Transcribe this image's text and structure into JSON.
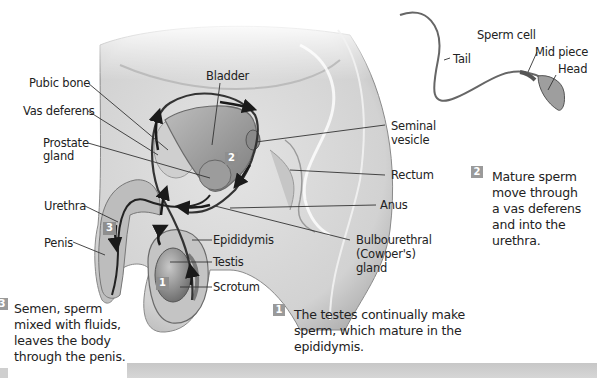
{
  "diagram": {
    "labels": {
      "pubic_bone": "Pubic bone",
      "vas_deferens": "Vas deferens",
      "prostate_line1": "Prostate",
      "prostate_line2": "gland",
      "bladder": "Bladder",
      "seminal_line1": "Seminal",
      "seminal_line2": "vesicle",
      "rectum": "Rectum",
      "anus": "Anus",
      "bulbo_line1": "Bulbourethral",
      "bulbo_line2": "(Cowper's)",
      "bulbo_line3": "gland",
      "urethra": "Urethra",
      "penis": "Penis",
      "epididymis": "Epididymis",
      "testis": "Testis",
      "scrotum": "Scrotum"
    },
    "sperm": {
      "title": "Sperm cell",
      "tail": "Tail",
      "mid_piece": "Mid piece",
      "head": "Head"
    },
    "markers": [
      "1",
      "2",
      "3"
    ],
    "steps": [
      {
        "number": "1",
        "lines": [
          "The testes continually make",
          "sperm, which mature in the",
          "epididymis."
        ]
      },
      {
        "number": "2",
        "lines": [
          "Mature sperm",
          "move through",
          "a vas deferens",
          "and into the",
          "urethra."
        ]
      },
      {
        "number": "3",
        "lines": [
          "Semen, sperm",
          "mixed with fluids,",
          "leaves the body",
          "through the penis."
        ]
      }
    ],
    "colors": {
      "body_fill": "#d9d9d9",
      "organ_fill": "#a8a8a8",
      "outline": "#6e6e6e",
      "arrow": "#1a1a1a",
      "badge": "#9a9a9a",
      "footer_bar": "#cccccc"
    }
  }
}
